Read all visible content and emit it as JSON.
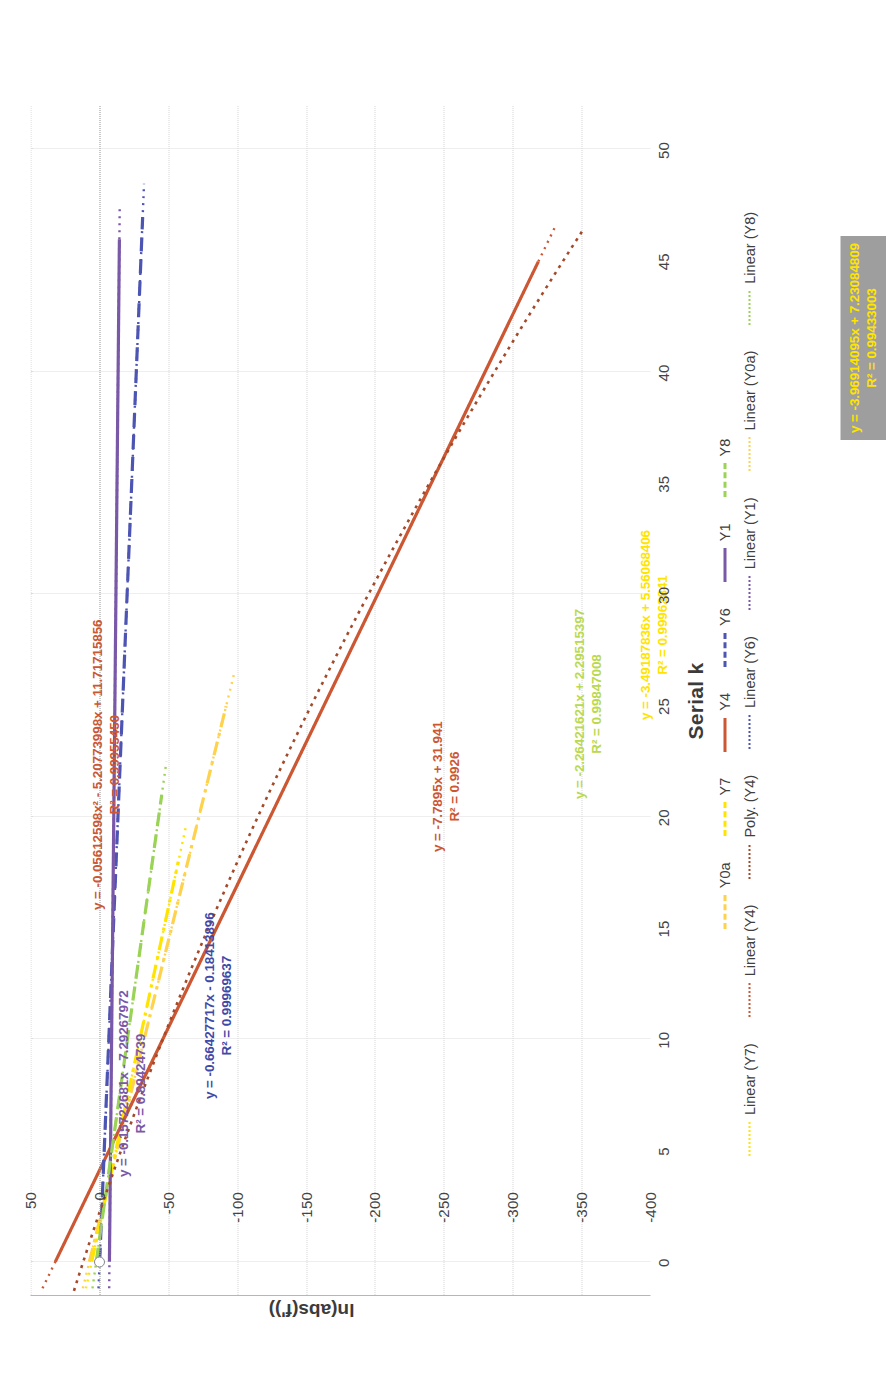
{
  "chart_data": {
    "type": "scatter",
    "title": "",
    "xlabel": "Serial k",
    "ylabel": "ln(abs(f'))",
    "xlim": [
      -1.5,
      52
    ],
    "ylim": [
      -400,
      50
    ],
    "xticks": [
      "0",
      "5",
      "10",
      "15",
      "20",
      "25",
      "30",
      "35",
      "40",
      "45",
      "50"
    ],
    "yticks": [
      "50",
      "0",
      "-50",
      "-100",
      "-150",
      "-200",
      "-250",
      "-300",
      "-350",
      "-400"
    ],
    "grid": true,
    "legend_position": "bottom",
    "series": [
      {
        "name": "Y0a",
        "color": "#ffd24d",
        "style": "dash-dot",
        "slope": -3.96914095,
        "intercept": 7.23084809,
        "xmax": 25
      },
      {
        "name": "Y7",
        "color": "#ffe400",
        "style": "dash-dot",
        "slope": -3.49187836,
        "intercept": 5.56068406,
        "xmax": 18
      },
      {
        "name": "Y4",
        "color": "#cc5733",
        "style": "solid",
        "slope": -7.7895,
        "intercept": 31.941,
        "xmax": 45
      },
      {
        "name": "Y6",
        "color": "#4d55b3",
        "style": "dash",
        "slope": -0.66427717,
        "intercept": -0.18413896,
        "xmax": 47
      },
      {
        "name": "Y1",
        "color": "#7a58a8",
        "style": "solid",
        "slope": -0.15722681,
        "intercept": -7.29267972,
        "xmax": 46
      },
      {
        "name": "Y8",
        "color": "#9ad356",
        "style": "dash",
        "slope": -2.26421621,
        "intercept": 2.29515397,
        "xmax": 21
      }
    ],
    "trendlines": [
      {
        "name": "Linear (Y7)",
        "color": "#ffe400"
      },
      {
        "name": "Linear (Y4)",
        "color": "#cc5733"
      },
      {
        "name": "Poly. (Y4)",
        "color": "#a34a2b"
      },
      {
        "name": "Linear (Y6)",
        "color": "#4d55b3"
      },
      {
        "name": "Linear (Y1)",
        "color": "#7a58a8"
      },
      {
        "name": "Linear (Y0a)",
        "color": "#ffd24d"
      },
      {
        "name": "Linear (Y8)",
        "color": "#9ad356"
      }
    ],
    "annotations": [
      {
        "id": "eq-y1",
        "equation": "y = -0.15722681x - 7.29267972",
        "r2": "R² = 0.89424739",
        "color": "#7a58a8",
        "series": "Y1"
      },
      {
        "id": "eq-y6",
        "equation": "y = -0.66427717x - 0.18413896",
        "r2": "R² = 0.99969637",
        "color": "#3f4aa8",
        "series": "Y6"
      },
      {
        "id": "eq-y4p",
        "equation": "y = -0.05612598x² - 5.20773998x + 11.71715856",
        "r2": "R² = 0.99955450",
        "color": "#cc5733",
        "series": "Poly. (Y4)"
      },
      {
        "id": "eq-y4l",
        "equation": "y = -7.7895x + 31.941",
        "r2": "R² = 0.9926",
        "color": "#cc5733",
        "series": "Y4"
      },
      {
        "id": "eq-y8",
        "equation": "y = -2.26421621x + 2.29515397",
        "r2": "R² = 0.99847008",
        "color": "#9ad356",
        "series": "Y8"
      },
      {
        "id": "eq-y7",
        "equation": "y = -3.49187836x + 5.56068406",
        "r2": "R² = 0.99962841",
        "color": "#ffe400",
        "series": "Y7"
      },
      {
        "id": "eq-y0a",
        "equation": "y = -3.96914095x + 7.23084809",
        "r2": "R² = 0.99433003",
        "color": "#ffe400",
        "series": "Y0a",
        "highlight": "#9e9e9e"
      }
    ]
  },
  "axes": {
    "x_title": "Serial k",
    "y_title": "ln(abs(f'))",
    "xticks": [
      "0",
      "5",
      "10",
      "15",
      "20",
      "25",
      "30",
      "35",
      "40",
      "45",
      "50"
    ],
    "yticks": [
      "50",
      "0",
      "-50",
      "-100",
      "-150",
      "-200",
      "-250",
      "-300",
      "-350",
      "-400"
    ]
  },
  "equations": {
    "y1": {
      "line1": "y = -0.15722681x - 7.29267972",
      "r2": "R² = 0.89424739"
    },
    "y6": {
      "line1": "y = -0.66427717x - 0.18413896",
      "r2": "R² = 0.99969637"
    },
    "y4p": {
      "line1": "y = -0.05612598x² - 5.20773998x + 11.71715856",
      "r2": "R² = 0.99955450"
    },
    "y4l": {
      "line1": "y = -7.7895x + 31.941",
      "r2": "R² = 0.9926"
    },
    "y8": {
      "line1": "y = -2.26421621x + 2.29515397",
      "r2": "R² = 0.99847008"
    },
    "y7": {
      "line1": "y = -3.49187836x + 5.56068406",
      "r2": "R² = 0.99962841"
    },
    "y0a": {
      "line1": "y = -3.96914095x + 7.23084809",
      "r2": "R² = 0.99433003"
    }
  },
  "legend": {
    "row1": [
      {
        "label": "Y0a",
        "color": "#ffd24d",
        "style": "dash-dot"
      },
      {
        "label": "Y7",
        "color": "#ffe400",
        "style": "dash-dot"
      },
      {
        "label": "Y4",
        "color": "#cc5733",
        "style": "solid"
      },
      {
        "label": "Y6",
        "color": "#4d55b3",
        "style": "dash"
      },
      {
        "label": "Y1",
        "color": "#7a58a8",
        "style": "solid"
      },
      {
        "label": "Y8",
        "color": "#9ad356",
        "style": "dash"
      }
    ],
    "row2": [
      {
        "label": "Linear (Y7)",
        "color": "#ffe400",
        "style": "dot"
      },
      {
        "label": "Linear (Y4)",
        "color": "#cc5733",
        "style": "dot"
      },
      {
        "label": "Poly. (Y4)",
        "color": "#a34a2b",
        "style": "dot"
      },
      {
        "label": "Linear (Y6)",
        "color": "#4d55b3",
        "style": "dot"
      },
      {
        "label": "Linear (Y1)",
        "color": "#7a58a8",
        "style": "dot"
      },
      {
        "label": "Linear (Y0a)",
        "color": "#ffd24d",
        "style": "dot"
      },
      {
        "label": "Linear (Y8)",
        "color": "#9ad356",
        "style": "dot"
      }
    ]
  }
}
